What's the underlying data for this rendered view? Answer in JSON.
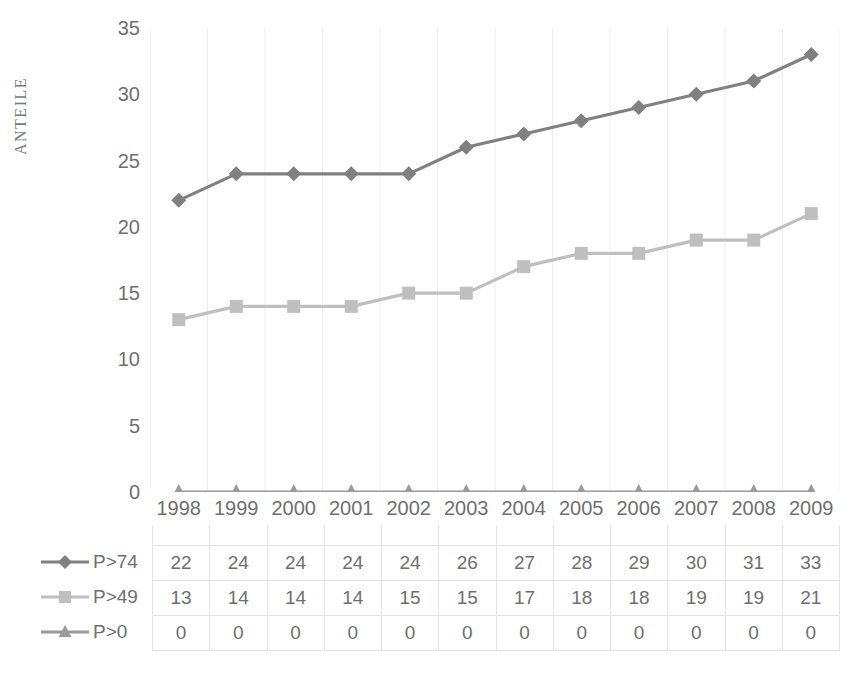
{
  "chart_data": {
    "type": "line",
    "title": "",
    "xlabel": "",
    "ylabel": "ANTEILE",
    "ylim": [
      0,
      35
    ],
    "yticks": [
      0,
      5,
      10,
      15,
      20,
      25,
      30,
      35
    ],
    "grid": "vertical-only",
    "legend_position": "data-table",
    "categories": [
      "1998",
      "1999",
      "2000",
      "2001",
      "2002",
      "2003",
      "2004",
      "2005",
      "2006",
      "2007",
      "2008",
      "2009"
    ],
    "series": [
      {
        "name": "P>74",
        "marker": "diamond",
        "color": "#808080",
        "values": [
          22,
          24,
          24,
          24,
          24,
          26,
          27,
          28,
          29,
          30,
          31,
          33
        ]
      },
      {
        "name": "P>49",
        "marker": "square",
        "color": "#bfbfbf",
        "values": [
          13,
          14,
          14,
          14,
          15,
          15,
          17,
          18,
          18,
          19,
          19,
          21
        ]
      },
      {
        "name": "P>0",
        "marker": "triangle",
        "color": "#9a9a9a",
        "values": [
          0,
          0,
          0,
          0,
          0,
          0,
          0,
          0,
          0,
          0,
          0,
          0
        ]
      }
    ]
  },
  "axis": {
    "y_title": "ANTEILE",
    "y_tick_labels": [
      "35",
      "30",
      "25",
      "20",
      "15",
      "10",
      "5",
      "0"
    ]
  },
  "table": {
    "year_headers": [
      "1998",
      "1999",
      "2000",
      "2001",
      "2002",
      "2003",
      "2004",
      "2005",
      "2006",
      "2007",
      "2008",
      "2009"
    ],
    "rows": [
      {
        "label": "P>74",
        "marker": "diamond",
        "color": "#808080",
        "cells": [
          "22",
          "24",
          "24",
          "24",
          "24",
          "26",
          "27",
          "28",
          "29",
          "30",
          "31",
          "33"
        ]
      },
      {
        "label": "P>49",
        "marker": "square",
        "color": "#bfbfbf",
        "cells": [
          "13",
          "14",
          "14",
          "14",
          "15",
          "15",
          "17",
          "18",
          "18",
          "19",
          "19",
          "21"
        ]
      },
      {
        "label": "P>0",
        "marker": "triangle",
        "color": "#9a9a9a",
        "cells": [
          "0",
          "0",
          "0",
          "0",
          "0",
          "0",
          "0",
          "0",
          "0",
          "0",
          "0",
          "0"
        ]
      }
    ]
  },
  "colors": {
    "series_1": "#808080",
    "series_2": "#bfbfbf",
    "series_3": "#9a9a9a",
    "gridline": "#eeeeee",
    "table_border": "#e3e3e3",
    "text": "#6f6f6f",
    "background": "#ffffff"
  }
}
